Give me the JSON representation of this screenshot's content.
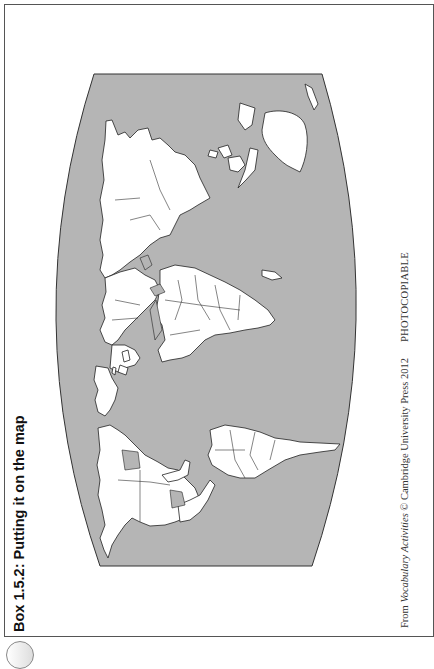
{
  "box": {
    "title": "Box 1.5.2: Putting it on the map"
  },
  "footer": {
    "from_prefix": "From ",
    "book_title": "Vocabulary Activities",
    "copyright": " © Cambridge University Press 2012",
    "photocopiable": "PHOTOCOPIABLE"
  },
  "map": {
    "description": "Blank political world outline map (rotated 90°), countries in white with black borders on a gray ocean",
    "ocean_color": "#b5b5b5",
    "land_color": "#ffffff",
    "border_color": "#222222",
    "orientation": "rotated 90 degrees counter-clockwise"
  },
  "colors": {
    "page": "#ffffff",
    "frame": "#555555",
    "text": "#111111"
  }
}
